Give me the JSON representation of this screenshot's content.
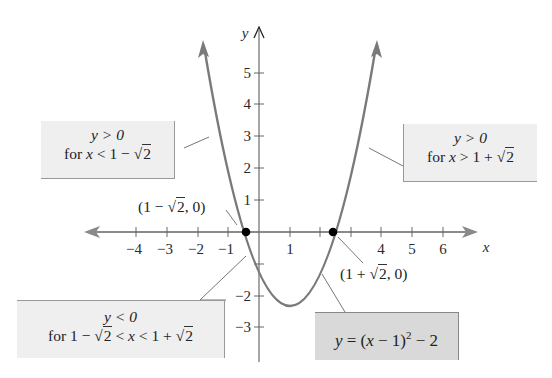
{
  "figure": {
    "function": "y = (x − 1)^2 − 2",
    "axis_labels": {
      "x": "x",
      "y": "y"
    },
    "x_ticks": [
      {
        "value": -4,
        "label": "−4"
      },
      {
        "value": -3,
        "label": "−3"
      },
      {
        "value": -2,
        "label": "−2"
      },
      {
        "value": -1,
        "label": "−1"
      },
      {
        "value": 1,
        "label": "1"
      },
      {
        "value": 2,
        "label": ""
      },
      {
        "value": 3,
        "label": ""
      },
      {
        "value": 4,
        "label": "4"
      },
      {
        "value": 5,
        "label": "5"
      },
      {
        "value": 6,
        "label": "6"
      }
    ],
    "y_ticks": [
      {
        "value": 5,
        "label": "5"
      },
      {
        "value": 4,
        "label": "4"
      },
      {
        "value": 3,
        "label": "3"
      },
      {
        "value": 2,
        "label": "2"
      },
      {
        "value": 1,
        "label": "1"
      },
      {
        "value": -1,
        "label": ""
      },
      {
        "value": -2,
        "label": "−2"
      },
      {
        "value": -3,
        "label": "−3"
      }
    ],
    "points": [
      {
        "label": "(1 − √2, 0)",
        "x": -0.414,
        "y": 0
      },
      {
        "label": "(1 + √2, 0)",
        "x": 2.414,
        "y": 0
      }
    ],
    "annotations": {
      "left_positive": {
        "line1": "y > 0",
        "line2_prefix": "for ",
        "line2_var": "x",
        "line2_rel": " < 1 − ",
        "line2_root": "2"
      },
      "right_positive": {
        "line1": "y > 0",
        "line2_prefix": "for ",
        "line2_var": "x",
        "line2_rel": " > 1 + ",
        "line2_root": "2"
      },
      "negative": {
        "line1": "y < 0",
        "line2_a": "for 1 − ",
        "line2_root1": "2",
        "line2_b": " < ",
        "line2_var": "x",
        "line2_c": " < 1 + ",
        "line2_root2": "2"
      },
      "equation": {
        "y": "y",
        "eq": " = (",
        "x": "x",
        "rest": " − 1)",
        "exp": "2",
        "tail": " − 2"
      }
    },
    "point_labels": {
      "left": {
        "pre": "(1 − ",
        "root": "2",
        "post": ", 0)"
      },
      "right": {
        "pre": "(1 + ",
        "root": "2",
        "post": ", 0)"
      }
    },
    "colors": {
      "curve": "#777777",
      "axis": "#888888",
      "box_fill": "#efefef",
      "equation_box_fill": "#d9d9d9",
      "point": "#000000"
    }
  }
}
